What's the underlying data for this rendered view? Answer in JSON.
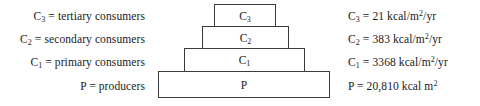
{
  "figure": {
    "type": "ecological-energy-pyramid",
    "tier_count": 4
  },
  "legend": {
    "rows": [
      {
        "symbol": "C",
        "sub": "3",
        "text": " = tertiary consumers"
      },
      {
        "symbol": "C",
        "sub": "2",
        "text": " = secondary consumers"
      },
      {
        "symbol": "C",
        "sub": "1",
        "text": " = primary consumers"
      },
      {
        "symbol": "P",
        "sub": "",
        "text": " = producers"
      }
    ]
  },
  "values": {
    "rows": [
      {
        "symbol": "C",
        "sub": "3",
        "eq": " = 21 kcal/m",
        "sup": "2",
        "tail": "/yr"
      },
      {
        "symbol": "C",
        "sub": "2",
        "eq": " = 383 kcal/m",
        "sup": "2",
        "tail": "/yr"
      },
      {
        "symbol": "C",
        "sub": "1",
        "eq": " = 3368 kcal/m",
        "sup": "2",
        "tail": "/yr"
      },
      {
        "symbol": "P",
        "sub": "",
        "eq": " = 20,810 kcal m",
        "sup": "2",
        "tail": ""
      }
    ]
  },
  "pyramid": {
    "tiers": [
      {
        "symbol": "C",
        "sub": "3",
        "level": "tertiary-consumers"
      },
      {
        "symbol": "C",
        "sub": "2",
        "level": "secondary-consumers"
      },
      {
        "symbol": "C",
        "sub": "1",
        "level": "primary-consumers"
      },
      {
        "symbol": "P",
        "sub": "",
        "level": "producers"
      }
    ]
  },
  "chart_data": {
    "type": "bar",
    "title": "",
    "xlabel": "",
    "ylabel": "",
    "orientation": "pyramid",
    "categories": [
      "C3",
      "C2",
      "C1",
      "P"
    ],
    "category_names": [
      "tertiary consumers",
      "secondary consumers",
      "primary consumers",
      "producers"
    ],
    "values": [
      21,
      383,
      3368,
      20810
    ],
    "units": [
      "kcal/m2/yr",
      "kcal/m2/yr",
      "kcal/m2/yr",
      "kcal m2"
    ],
    "value_labels": [
      "21 kcal/m2/yr",
      "383 kcal/m2/yr",
      "3368 kcal/m2/yr",
      "20,810 kcal m2"
    ],
    "grid": false,
    "legend_position": "left"
  },
  "colors": {
    "box_border": "#3a3a3a",
    "box_fill": "#ffffff",
    "text": "#1a1a1a",
    "background": "#ffffff"
  }
}
